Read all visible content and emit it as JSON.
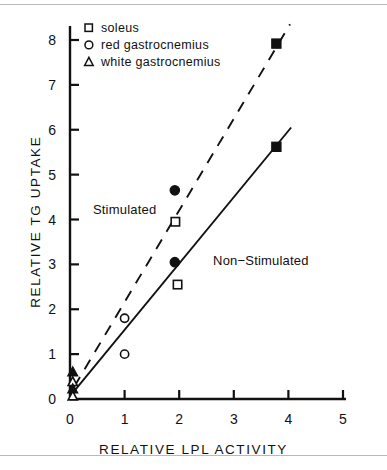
{
  "chart_data": {
    "type": "scatter",
    "title": "",
    "xlabel": "RELATIVE LPL ACTIVITY",
    "ylabel": "RELATIVE TG UPTAKE",
    "xlim": [
      0,
      5
    ],
    "ylim": [
      0,
      8.35
    ],
    "xticks": [
      0,
      1,
      2,
      3,
      4,
      5
    ],
    "yticks": [
      0,
      1,
      2,
      3,
      4,
      5,
      6,
      7,
      8
    ],
    "xtick_labels": [
      "0",
      "1",
      "2",
      "3",
      "4",
      "5"
    ],
    "ytick_labels": [
      "0",
      "1",
      "2",
      "3",
      "4",
      "5",
      "6",
      "7",
      "8"
    ],
    "grid": false,
    "legend_position": "upper-left-inside",
    "legend": [
      {
        "key": "soleus",
        "label": "soleus",
        "marker": "square-open"
      },
      {
        "key": "red_gastrocnemius",
        "label": "red  gastrocnemius",
        "marker": "circle-open"
      },
      {
        "key": "white_gastrocnemius",
        "label": "white gastrocnemius",
        "marker": "triangle-open"
      }
    ],
    "annotations": [
      {
        "text": "Stimulated",
        "x": 0.42,
        "y": 4.22
      },
      {
        "text": "Non−Stimulated",
        "x": 2.62,
        "y": 3.08
      }
    ],
    "series": [
      {
        "name": "Stimulated",
        "line_style": "dashed",
        "fit_line": {
          "x0": 0.08,
          "y0": 0.28,
          "x1": 4.03,
          "y1": 8.35
        },
        "points": [
          {
            "x": 3.78,
            "y": 7.92,
            "marker": "square-filled",
            "muscle": "soleus"
          },
          {
            "x": 1.92,
            "y": 4.65,
            "marker": "circle-filled",
            "muscle": "red_gastrocnemius"
          },
          {
            "x": 1.93,
            "y": 3.95,
            "marker": "square-open",
            "muscle": "soleus"
          },
          {
            "x": 1.0,
            "y": 1.8,
            "marker": "circle-open",
            "muscle": "red_gastrocnemius"
          },
          {
            "x": 0.05,
            "y": 0.6,
            "marker": "triangle-filled",
            "muscle": "white_gastrocnemius"
          },
          {
            "x": 0.05,
            "y": 0.38,
            "marker": "triangle-open",
            "muscle": "white_gastrocnemius"
          }
        ]
      },
      {
        "name": "Non-Stimulated",
        "line_style": "solid",
        "fit_line": {
          "x0": 0.08,
          "y0": 0.18,
          "x1": 4.05,
          "y1": 6.05
        },
        "points": [
          {
            "x": 3.78,
            "y": 5.62,
            "marker": "square-filled",
            "muscle": "soleus"
          },
          {
            "x": 1.92,
            "y": 3.05,
            "marker": "circle-filled",
            "muscle": "red_gastrocnemius"
          },
          {
            "x": 1.97,
            "y": 2.55,
            "marker": "square-open",
            "muscle": "soleus"
          },
          {
            "x": 1.0,
            "y": 1.0,
            "marker": "circle-open",
            "muscle": "red_gastrocnemius"
          },
          {
            "x": 0.05,
            "y": 0.22,
            "marker": "triangle-filled",
            "muscle": "white_gastrocnemius"
          },
          {
            "x": 0.05,
            "y": 0.06,
            "marker": "triangle-open",
            "muscle": "white_gastrocnemius"
          }
        ]
      }
    ]
  },
  "style": {
    "ink": "#111111",
    "paper": "#ffffff",
    "rule": "#b9b9b9"
  }
}
